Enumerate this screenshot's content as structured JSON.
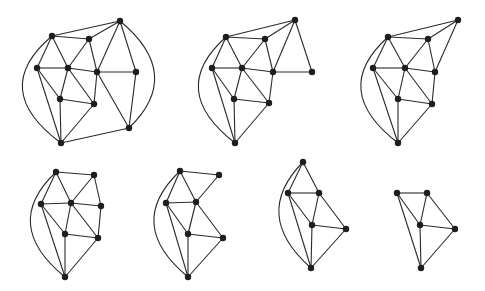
{
  "diagram": {
    "style": {
      "edge_color": "#2a2a2a",
      "node_color": "#1e1e1e",
      "background": "#ffffff",
      "node_radius": 3.2
    },
    "graphs": [
      {
        "id": "g1",
        "nodes": {
          "A": [
            120,
            21
          ],
          "B": [
            52,
            36
          ],
          "C": [
            89,
            39
          ],
          "D": [
            37,
            68
          ],
          "E": [
            68,
            68
          ],
          "F": [
            97,
            72
          ],
          "G": [
            136,
            72
          ],
          "H": [
            60,
            99
          ],
          "I": [
            94,
            104
          ],
          "J": [
            129,
            128
          ],
          "K": [
            61,
            143
          ]
        },
        "edges": [
          [
            "B",
            "A"
          ],
          [
            "C",
            "A"
          ],
          [
            "B",
            "C"
          ],
          [
            "B",
            "D"
          ],
          [
            "B",
            "E"
          ],
          [
            "C",
            "E"
          ],
          [
            "C",
            "F"
          ],
          [
            "D",
            "E"
          ],
          [
            "E",
            "F"
          ],
          [
            "F",
            "G"
          ],
          [
            "A",
            "F"
          ],
          [
            "A",
            "G"
          ],
          [
            "G",
            "J"
          ],
          [
            "F",
            "I"
          ],
          [
            "F",
            "J"
          ],
          [
            "E",
            "H"
          ],
          [
            "E",
            "I"
          ],
          [
            "H",
            "I"
          ],
          [
            "D",
            "H"
          ],
          [
            "D",
            "K"
          ],
          [
            "H",
            "K"
          ],
          [
            "I",
            "K"
          ],
          [
            "K",
            "J"
          ]
        ],
        "arcs": [
          {
            "from": "B",
            "to": "K",
            "side": "left",
            "bulge": -34
          },
          {
            "from": "A",
            "to": "J",
            "side": "right",
            "bulge": 30
          }
        ]
      },
      {
        "id": "g2",
        "nodes": {
          "A": [
            295,
            20
          ],
          "B": [
            226,
            37
          ],
          "C": [
            265,
            39
          ],
          "D": [
            212,
            68
          ],
          "E": [
            242,
            68
          ],
          "F": [
            273,
            72
          ],
          "G": [
            312,
            72
          ],
          "H": [
            234,
            99
          ],
          "I": [
            269,
            103
          ],
          "K": [
            235,
            143
          ]
        },
        "edges": [
          [
            "B",
            "A"
          ],
          [
            "C",
            "A"
          ],
          [
            "B",
            "C"
          ],
          [
            "B",
            "D"
          ],
          [
            "B",
            "E"
          ],
          [
            "C",
            "E"
          ],
          [
            "C",
            "F"
          ],
          [
            "D",
            "E"
          ],
          [
            "E",
            "F"
          ],
          [
            "F",
            "G"
          ],
          [
            "A",
            "F"
          ],
          [
            "A",
            "G"
          ],
          [
            "E",
            "H"
          ],
          [
            "E",
            "I"
          ],
          [
            "H",
            "I"
          ],
          [
            "D",
            "H"
          ],
          [
            "D",
            "K"
          ],
          [
            "H",
            "K"
          ],
          [
            "I",
            "K"
          ],
          [
            "F",
            "I"
          ]
        ],
        "arcs": [
          {
            "from": "B",
            "to": "K",
            "side": "left",
            "bulge": -32
          }
        ]
      },
      {
        "id": "g3",
        "nodes": {
          "A": [
            458,
            20
          ],
          "B": [
            388,
            37
          ],
          "C": [
            428,
            39
          ],
          "D": [
            373,
            68
          ],
          "E": [
            405,
            68
          ],
          "F": [
            435,
            72
          ],
          "H": [
            398,
            99
          ],
          "I": [
            432,
            104
          ],
          "K": [
            398,
            143
          ]
        },
        "edges": [
          [
            "B",
            "A"
          ],
          [
            "C",
            "A"
          ],
          [
            "B",
            "C"
          ],
          [
            "B",
            "D"
          ],
          [
            "B",
            "E"
          ],
          [
            "C",
            "E"
          ],
          [
            "C",
            "F"
          ],
          [
            "A",
            "F"
          ],
          [
            "D",
            "E"
          ],
          [
            "E",
            "F"
          ],
          [
            "F",
            "I"
          ],
          [
            "E",
            "H"
          ],
          [
            "E",
            "I"
          ],
          [
            "H",
            "I"
          ],
          [
            "D",
            "H"
          ],
          [
            "D",
            "K"
          ],
          [
            "H",
            "K"
          ],
          [
            "I",
            "K"
          ]
        ],
        "arcs": [
          {
            "from": "B",
            "to": "K",
            "side": "left",
            "bulge": -32
          }
        ]
      },
      {
        "id": "g4",
        "nodes": {
          "B": [
            56,
            172
          ],
          "C": [
            94,
            175
          ],
          "D": [
            41,
            204
          ],
          "E": [
            71,
            203
          ],
          "F": [
            101,
            206
          ],
          "H": [
            65,
            234
          ],
          "I": [
            98,
            238
          ],
          "K": [
            65,
            277
          ]
        },
        "edges": [
          [
            "B",
            "C"
          ],
          [
            "B",
            "D"
          ],
          [
            "B",
            "E"
          ],
          [
            "C",
            "E"
          ],
          [
            "C",
            "F"
          ],
          [
            "D",
            "E"
          ],
          [
            "E",
            "F"
          ],
          [
            "F",
            "I"
          ],
          [
            "E",
            "H"
          ],
          [
            "E",
            "I"
          ],
          [
            "H",
            "I"
          ],
          [
            "D",
            "H"
          ],
          [
            "D",
            "K"
          ],
          [
            "H",
            "K"
          ],
          [
            "I",
            "K"
          ]
        ],
        "arcs": [
          {
            "from": "B",
            "to": "K",
            "side": "left",
            "bulge": -30
          }
        ]
      },
      {
        "id": "g5",
        "nodes": {
          "B": [
            180,
            171
          ],
          "C": [
            219,
            175
          ],
          "D": [
            166,
            203
          ],
          "E": [
            196,
            202
          ],
          "H": [
            188,
            234
          ],
          "I": [
            223,
            238
          ],
          "K": [
            188,
            277
          ]
        },
        "edges": [
          [
            "B",
            "C"
          ],
          [
            "B",
            "D"
          ],
          [
            "B",
            "E"
          ],
          [
            "C",
            "E"
          ],
          [
            "D",
            "E"
          ],
          [
            "E",
            "H"
          ],
          [
            "E",
            "I"
          ],
          [
            "H",
            "I"
          ],
          [
            "D",
            "H"
          ],
          [
            "D",
            "K"
          ],
          [
            "H",
            "K"
          ],
          [
            "I",
            "K"
          ]
        ],
        "arcs": [
          {
            "from": "B",
            "to": "K",
            "side": "left",
            "bulge": -30
          }
        ]
      },
      {
        "id": "g6",
        "nodes": {
          "B": [
            303,
            162
          ],
          "D": [
            288,
            193
          ],
          "E": [
            319,
            193
          ],
          "H": [
            312,
            225
          ],
          "I": [
            346,
            229
          ],
          "K": [
            311,
            268
          ]
        },
        "edges": [
          [
            "B",
            "D"
          ],
          [
            "B",
            "E"
          ],
          [
            "D",
            "E"
          ],
          [
            "D",
            "H"
          ],
          [
            "E",
            "H"
          ],
          [
            "E",
            "I"
          ],
          [
            "H",
            "I"
          ],
          [
            "D",
            "K"
          ],
          [
            "H",
            "K"
          ],
          [
            "I",
            "K"
          ]
        ],
        "arcs": [
          {
            "from": "B",
            "to": "K",
            "side": "left",
            "bulge": -28
          }
        ]
      },
      {
        "id": "g7",
        "nodes": {
          "D": [
            397,
            193
          ],
          "E": [
            427,
            193
          ],
          "H": [
            420,
            225
          ],
          "I": [
            455,
            229
          ],
          "K": [
            421,
            268
          ]
        },
        "edges": [
          [
            "D",
            "E"
          ],
          [
            "D",
            "H"
          ],
          [
            "E",
            "H"
          ],
          [
            "E",
            "I"
          ],
          [
            "H",
            "I"
          ],
          [
            "D",
            "K"
          ],
          [
            "H",
            "K"
          ],
          [
            "I",
            "K"
          ]
        ],
        "arcs": []
      }
    ]
  }
}
